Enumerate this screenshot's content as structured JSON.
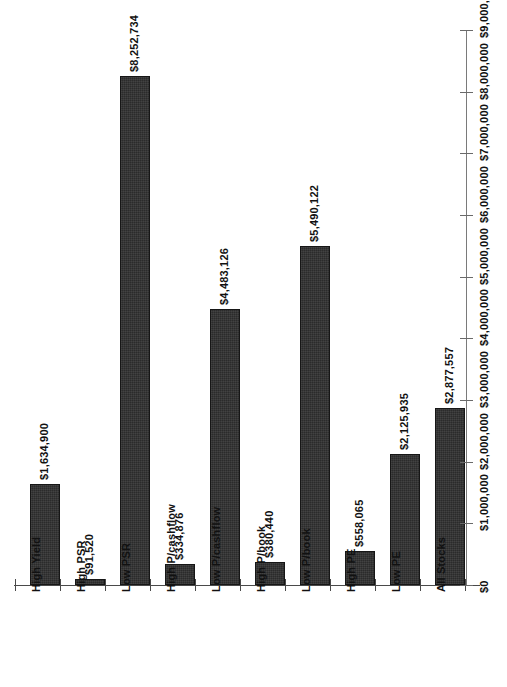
{
  "chart_data": {
    "type": "bar",
    "title": "",
    "subtitle": "",
    "xlabel": "",
    "ylabel": "",
    "orientation": "vertical",
    "grid": false,
    "legend": null,
    "y_axis_position": "right",
    "tick_label_rotation": "-90",
    "category_label_rotation": "-90",
    "bar_color": "#2b2b2b",
    "ylim": [
      0,
      9000000
    ],
    "ytick_values": [
      0,
      1000000,
      2000000,
      3000000,
      4000000,
      5000000,
      6000000,
      7000000,
      8000000,
      9000000
    ],
    "ytick_labels": [
      "$0",
      "$1,000,000",
      "$2,000,000",
      "$3,000,000",
      "$4,000,000",
      "$5,000,000",
      "$6,000,000",
      "$7,000,000",
      "$8,000,000",
      "$9,000,000"
    ],
    "categories": [
      "High Yield",
      "High PSR",
      "Low PSR",
      "High P/cashflow",
      "Low P/cashflow",
      "High P/book",
      "Low P/book",
      "High PE",
      "Low PE",
      "All Stocks"
    ],
    "values": [
      1634900,
      91520,
      8252734,
      334876,
      4483126,
      380440,
      5490122,
      558065,
      2125935,
      2877557
    ],
    "data_labels": [
      "$1,634,900",
      "$91,520",
      "$8,252,734",
      "$334,876",
      "$4,483,126",
      "$380,440",
      "$5,490,122",
      "$558,065",
      "$2,125,935",
      "$2,877,557"
    ]
  }
}
